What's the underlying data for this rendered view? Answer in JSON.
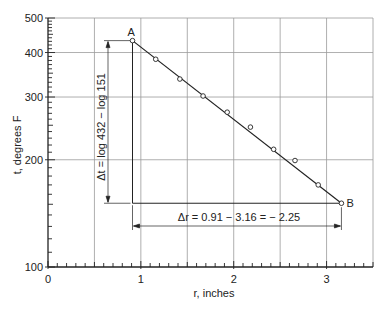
{
  "chart_data": {
    "type": "scatter",
    "title": "",
    "xlabel": "r, inches",
    "ylabel": "t, degrees F",
    "xscale": "linear",
    "yscale": "log",
    "xlim": [
      0,
      3.5
    ],
    "ylim": [
      100,
      500
    ],
    "x_ticks": [
      0,
      1,
      2,
      3
    ],
    "x_tick_labels": [
      "0",
      "1",
      "2",
      "3"
    ],
    "y_ticks": [
      100,
      200,
      300,
      400,
      500
    ],
    "y_tick_labels": [
      "100",
      "200",
      "300",
      "400",
      "500"
    ],
    "grid": true,
    "x_gridlines": [
      0.5,
      1,
      1.5,
      2,
      2.5,
      3,
      3.5
    ],
    "y_gridlines": [
      200,
      300,
      400,
      500
    ],
    "series": [
      {
        "name": "measured",
        "marker": "open-circle",
        "x": [
          0.91,
          1.16,
          1.42,
          1.67,
          1.93,
          2.18,
          2.43,
          2.66,
          2.91,
          3.16
        ],
        "y": [
          432,
          383,
          337,
          302,
          272,
          247,
          214,
          199,
          170,
          151
        ]
      },
      {
        "name": "fit-line",
        "marker": "none",
        "x": [
          0.91,
          3.16
        ],
        "y": [
          432,
          151
        ]
      }
    ],
    "points": {
      "A": {
        "label": "A",
        "r": 0.91,
        "t": 432
      },
      "B": {
        "label": "B",
        "r": 3.16,
        "t": 151
      }
    },
    "annotations": {
      "delta_t": "Δt = log 432 − log 151",
      "delta_r": "Δr = 0.91 − 3.16 = − 2.25"
    }
  }
}
